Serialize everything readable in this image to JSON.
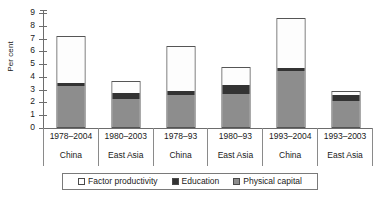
{
  "chart_data": {
    "type": "bar",
    "subtype": "stacked-bar",
    "title": "",
    "xlabel": "",
    "ylabel": "Per cent",
    "ylim": [
      0,
      9
    ],
    "yticks": [
      0,
      1,
      2,
      3,
      4,
      5,
      6,
      7,
      8,
      9
    ],
    "ytick_labels": [
      "0",
      "1",
      "2",
      "3",
      "4",
      "5",
      "6",
      "7",
      "8",
      "9"
    ],
    "grid": false,
    "legend_position": "bottom",
    "categories": [
      "1978–2004 China",
      "1980–2003 East Asia",
      "1978–93 China",
      "1980–93 East Asia",
      "1993–2004 China",
      "1993–2003 East Asia"
    ],
    "category_periods": [
      "1978–2004",
      "1980–2003",
      "1978–93",
      "1980–93",
      "1993–2004",
      "1993–2003"
    ],
    "category_regions": [
      "China",
      "East Asia",
      "China",
      "East Asia",
      "China",
      "East Asia"
    ],
    "series": [
      {
        "name": "Physical capital",
        "color": "#8d8d8d",
        "values": [
          3.3,
          2.3,
          2.6,
          2.7,
          4.45,
          2.15
        ]
      },
      {
        "name": "Education",
        "color": "#333333",
        "values": [
          0.2,
          0.5,
          0.25,
          0.7,
          0.25,
          0.5
        ]
      },
      {
        "name": "Factor productivity",
        "color": "#ffffff",
        "values": [
          3.7,
          0.85,
          3.6,
          1.4,
          3.9,
          0.25
        ]
      }
    ],
    "cumulative_tops": [
      [
        3.3,
        3.5,
        7.2
      ],
      [
        2.3,
        2.8,
        3.65
      ],
      [
        2.6,
        2.85,
        6.45
      ],
      [
        2.7,
        3.4,
        4.8
      ],
      [
        4.45,
        4.7,
        8.6
      ],
      [
        2.15,
        2.65,
        2.9
      ]
    ],
    "totals": [
      7.2,
      3.65,
      6.45,
      4.8,
      8.6,
      2.9
    ]
  },
  "legend": {
    "items": [
      {
        "label": "Factor productivity",
        "swatch": "white-swatch"
      },
      {
        "label": "Education",
        "swatch": "black-swatch"
      },
      {
        "label": "Physical capital",
        "swatch": "grey-swatch"
      }
    ]
  }
}
